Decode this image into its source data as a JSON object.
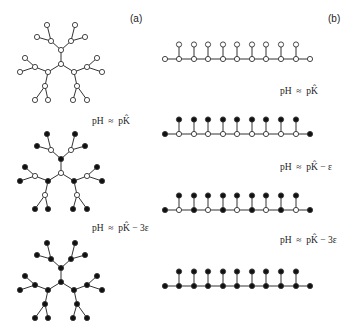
{
  "panels": {
    "a": "(a)",
    "b": "(b)"
  },
  "labels": {
    "a1": "pH  ≈  pK̂",
    "a2": "pH  ≈  pK̂ − 3ε",
    "b1": "pH  ≈  pK̂",
    "b2": "pH  ≈  pK̂ − ε",
    "b3": "pH  ≈  pK̂ − 3ε"
  },
  "colors": {
    "stroke": "#333333",
    "filled": "#111111",
    "open": "#ffffff"
  },
  "trees": [
    {
      "cy": 64,
      "center": "open",
      "hub": "open",
      "branch": "open",
      "leaf": "open"
    },
    {
      "cy": 173,
      "center": "open",
      "hub": "filled",
      "branch": "open",
      "leaf": "filled"
    },
    {
      "cy": 282,
      "center": "filled",
      "hub": "filled",
      "branch": "filled",
      "leaf": "filled"
    }
  ],
  "chains": [
    {
      "y": 59,
      "ends": "open",
      "spine": [
        "open",
        "open",
        "open",
        "open",
        "open",
        "open",
        "open",
        "open",
        "open"
      ],
      "pendant": "open"
    },
    {
      "y": 134,
      "ends": "filled",
      "spine": [
        "open",
        "open",
        "open",
        "open",
        "open",
        "open",
        "open",
        "open",
        "open"
      ],
      "pendant": "filled"
    },
    {
      "y": 210,
      "ends": "filled",
      "spine": [
        "open",
        "filled",
        "open",
        "filled",
        "open",
        "filled",
        "open",
        "filled",
        "open"
      ],
      "pendant": "filled"
    },
    {
      "y": 286,
      "ends": "filled",
      "spine": [
        "filled",
        "filled",
        "filled",
        "filled",
        "filled",
        "filled",
        "filled",
        "filled",
        "filled"
      ],
      "pendant": "filled"
    }
  ]
}
